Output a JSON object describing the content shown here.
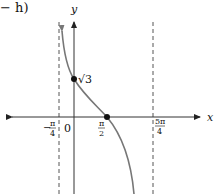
{
  "caption_fragment": "− h)",
  "graph": {
    "x_axis_label": "x",
    "y_axis_label": "y",
    "origin_label": "0",
    "tick_labels": {
      "neg_pi_over_4": {
        "sign": "−",
        "num": "π",
        "den": "4"
      },
      "pi_over_2": {
        "num": "π",
        "den": "2"
      },
      "five_pi_over_4": {
        "num": "5π",
        "den": "4"
      }
    },
    "point_labels": {
      "y_intercept": "√3"
    },
    "asymptotes": [
      "x = −π/4",
      "x = 5π/4"
    ],
    "points": [
      {
        "name": "y-intercept",
        "x": "0",
        "y": "√3"
      },
      {
        "name": "x-intercept",
        "x": "π/2",
        "y": "0"
      }
    ],
    "colors": {
      "axis": "#333333",
      "curve": "#777777",
      "asymptote": "#555555",
      "point": "#111111"
    }
  }
}
